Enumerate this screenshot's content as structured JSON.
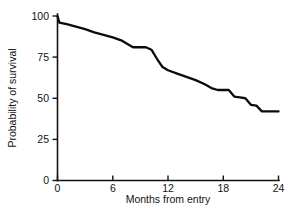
{
  "chart_data": {
    "type": "line",
    "title": "",
    "subtitle": "",
    "xlabel": "Months from entry",
    "ylabel": "Probability of survival",
    "xlim": [
      0,
      24
    ],
    "ylim": [
      0,
      100
    ],
    "xticks": [
      0,
      6,
      12,
      18,
      24
    ],
    "xtick_labels": [
      "0",
      "6",
      "12",
      "18",
      "24"
    ],
    "yticks": [
      0,
      25,
      50,
      75,
      100
    ],
    "ytick_labels": [
      "0",
      "25",
      "50",
      "75",
      "100"
    ],
    "grid": false,
    "legend": false,
    "legend_position": "none",
    "line_color": "#0b0b0b",
    "background_color": "#ffffff",
    "axis_color": "#121212",
    "series": [
      {
        "name": "Survival",
        "x": [
          0.0,
          0.2,
          1.0,
          2.0,
          3.0,
          4.0,
          5.0,
          6.0,
          7.0,
          7.6,
          8.2,
          9.6,
          10.2,
          10.8,
          11.4,
          12.0,
          13.0,
          14.0,
          15.0,
          16.0,
          16.8,
          17.4,
          18.6,
          19.2,
          19.8,
          20.4,
          21.0,
          21.6,
          22.2,
          24.0
        ],
        "values": [
          100,
          96,
          95,
          93.5,
          92,
          90,
          88.5,
          87,
          85,
          83,
          81,
          81,
          79.5,
          74,
          69,
          67,
          65,
          63,
          61,
          58.5,
          56,
          55,
          55,
          51,
          50.5,
          50,
          46,
          45.5,
          42,
          42
        ]
      }
    ]
  },
  "axis_titles": {
    "x": "Months from entry",
    "y": "Probability of survival"
  }
}
